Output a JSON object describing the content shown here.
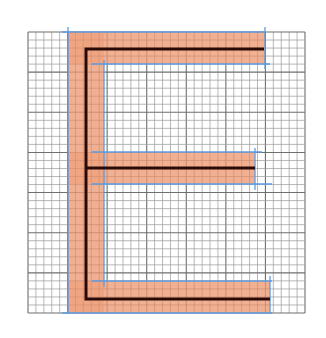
{
  "diagram": {
    "letter": "E",
    "canvas": {
      "width": 326,
      "height": 338,
      "background": "#ffffff"
    },
    "grid": {
      "x0": 28,
      "y0": 32,
      "x1": 305,
      "y1": 313,
      "minor_step": 8,
      "major_every": 5,
      "minor_color": "#9a9a9a",
      "major_color": "#6e6e6e"
    },
    "colors": {
      "fill": "#eea27f",
      "skeleton": "#2a0a06",
      "guide": "#5b9be0"
    },
    "shapes": {
      "stem": {
        "x": 68,
        "y": 32,
        "w": 36,
        "h": 281
      },
      "top_arm": {
        "x": 68,
        "y": 32,
        "w": 197,
        "h": 32
      },
      "middle_arm": {
        "x": 68,
        "y": 152,
        "w": 187,
        "h": 32
      },
      "bottom_arm": {
        "x": 68,
        "y": 281,
        "w": 202,
        "h": 32
      }
    },
    "skeleton": {
      "stem_x": 86,
      "top_y": 49,
      "mid_y": 168,
      "bottom_y": 299,
      "top_end_x": 264,
      "mid_end_x": 255,
      "bottom_end_x": 270,
      "width": 3
    },
    "guides": [
      {
        "x1": 68,
        "y1": 27,
        "x2": 68,
        "y2": 313
      },
      {
        "x1": 62,
        "y1": 32,
        "x2": 265,
        "y2": 32
      },
      {
        "x1": 265,
        "y1": 27,
        "x2": 265,
        "y2": 69
      },
      {
        "x1": 92,
        "y1": 64,
        "x2": 270,
        "y2": 64
      },
      {
        "x1": 104,
        "y1": 60,
        "x2": 104,
        "y2": 287
      },
      {
        "x1": 92,
        "y1": 152,
        "x2": 262,
        "y2": 152
      },
      {
        "x1": 92,
        "y1": 184,
        "x2": 272,
        "y2": 184
      },
      {
        "x1": 255,
        "y1": 148,
        "x2": 255,
        "y2": 190
      },
      {
        "x1": 92,
        "y1": 281,
        "x2": 272,
        "y2": 281
      },
      {
        "x1": 270,
        "y1": 276,
        "x2": 270,
        "y2": 313
      },
      {
        "x1": 62,
        "y1": 313,
        "x2": 272,
        "y2": 313
      }
    ]
  }
}
